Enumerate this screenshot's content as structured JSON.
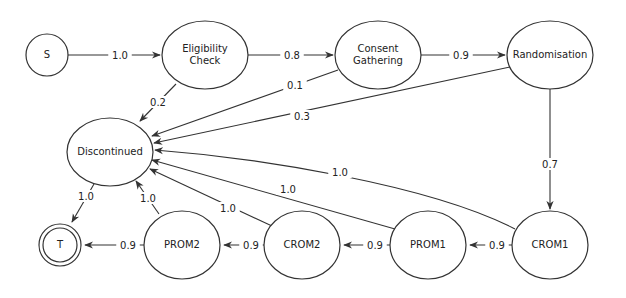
{
  "diagram": {
    "type": "state-transition-diagram",
    "nodes": [
      {
        "id": "S",
        "label": "S",
        "shape": "circle",
        "cx": 47,
        "cy": 55,
        "rx": 21,
        "ry": 21
      },
      {
        "id": "EC",
        "label": "Eligibility Check",
        "lines": [
          "Eligibility",
          "Check"
        ],
        "shape": "ellipse",
        "cx": 205,
        "cy": 55,
        "rx": 43,
        "ry": 34
      },
      {
        "id": "CG",
        "label": "Consent Gathering",
        "lines": [
          "Consent",
          "Gathering"
        ],
        "shape": "ellipse",
        "cx": 378,
        "cy": 55,
        "rx": 43,
        "ry": 34
      },
      {
        "id": "R",
        "label": "Randomisation",
        "lines": [
          "Randomisation"
        ],
        "shape": "ellipse",
        "cx": 550,
        "cy": 55,
        "rx": 43,
        "ry": 34
      },
      {
        "id": "D",
        "label": "Discontinued",
        "lines": [
          "Discontinued"
        ],
        "shape": "ellipse",
        "cx": 110,
        "cy": 152,
        "rx": 43,
        "ry": 34
      },
      {
        "id": "T",
        "label": "T",
        "shape": "double-circle",
        "cx": 60,
        "cy": 245,
        "rx": 21,
        "ry": 21
      },
      {
        "id": "PROM2",
        "label": "PROM2",
        "lines": [
          "PROM2"
        ],
        "shape": "ellipse",
        "cx": 182,
        "cy": 245,
        "rx": 38,
        "ry": 34
      },
      {
        "id": "CROM2",
        "label": "CROM2",
        "lines": [
          "CROM2"
        ],
        "shape": "ellipse",
        "cx": 302,
        "cy": 245,
        "rx": 38,
        "ry": 34
      },
      {
        "id": "PROM1",
        "label": "PROM1",
        "lines": [
          "PROM1"
        ],
        "shape": "ellipse",
        "cx": 428,
        "cy": 245,
        "rx": 38,
        "ry": 34
      },
      {
        "id": "CROM1",
        "label": "CROM1",
        "lines": [
          "CROM1"
        ],
        "shape": "ellipse",
        "cx": 550,
        "cy": 245,
        "rx": 38,
        "ry": 34
      }
    ],
    "edges": [
      {
        "from": "S",
        "to": "EC",
        "label": "1.0",
        "path": "M68,55 L160,55",
        "lx": 120,
        "ly": 55
      },
      {
        "from": "EC",
        "to": "CG",
        "label": "0.8",
        "path": "M248,55 L333,55",
        "lx": 292,
        "ly": 55
      },
      {
        "from": "CG",
        "to": "R",
        "label": "0.9",
        "path": "M421,55 L505,55",
        "lx": 461,
        "ly": 55
      },
      {
        "from": "EC",
        "to": "D",
        "label": "0.2",
        "path": "M176,84 L140,121",
        "lx": 158,
        "ly": 102
      },
      {
        "from": "CG",
        "to": "D",
        "label": "0.1",
        "path": "M338,70 L152,136",
        "lx": 295,
        "ly": 85
      },
      {
        "from": "R",
        "to": "D",
        "label": "0.3",
        "path": "M510,67 L154,143",
        "lx": 302,
        "ly": 116
      },
      {
        "from": "R",
        "to": "CROM1",
        "label": "0.7",
        "path": "M550,89 L550,209",
        "lx": 550,
        "ly": 164
      },
      {
        "from": "CROM1",
        "to": "D",
        "label": "1.0",
        "path": "M515,229 C430,185 260,158 155,150",
        "lx": 340,
        "ly": 172
      },
      {
        "from": "PROM1",
        "to": "D",
        "label": "1.0",
        "path": "M395,229 L152,160",
        "lx": 288,
        "ly": 189
      },
      {
        "from": "CROM2",
        "to": "D",
        "label": "1.0",
        "path": "M272,226 L150,169",
        "lx": 228,
        "ly": 208
      },
      {
        "from": "PROM2",
        "to": "D",
        "label": "1.0",
        "path": "M159,214 L136,181",
        "lx": 148,
        "ly": 198
      },
      {
        "from": "D",
        "to": "T",
        "label": "1.0",
        "path": "M94,184 L72,222",
        "lx": 86,
        "ly": 196
      },
      {
        "from": "CROM1",
        "to": "PROM1",
        "label": "0.9",
        "path": "M512,245 L470,245",
        "lx": 497,
        "ly": 245
      },
      {
        "from": "PROM1",
        "to": "CROM2",
        "label": "0.9",
        "path": "M390,245 L344,245",
        "lx": 375,
        "ly": 245
      },
      {
        "from": "CROM2",
        "to": "PROM2",
        "label": "0.9",
        "path": "M264,245 L224,245",
        "lx": 251,
        "ly": 245
      },
      {
        "from": "PROM2",
        "to": "T",
        "label": "0.9",
        "path": "M144,245 L85,245",
        "lx": 128,
        "ly": 245
      }
    ]
  },
  "colors": {
    "stroke": "#333333",
    "text": "#222222",
    "background": "#ffffff"
  }
}
